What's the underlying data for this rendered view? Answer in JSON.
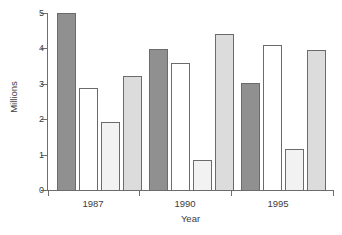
{
  "chart_data": {
    "type": "bar",
    "title": "",
    "xlabel": "Year",
    "ylabel": "Millions",
    "categories": [
      "1987",
      "1990",
      "1995"
    ],
    "ylim": [
      0,
      5
    ],
    "yticks": [
      0,
      1,
      2,
      3,
      4,
      5
    ],
    "ytick_labels": [
      "0",
      "1",
      "2",
      "3",
      "4",
      "5"
    ],
    "grid": false,
    "legend": "none",
    "series": [
      {
        "name": "Series 1",
        "color": "#909090",
        "values": [
          5.0,
          4.0,
          3.03
        ]
      },
      {
        "name": "Series 2",
        "color": "#ffffff",
        "values": [
          2.9,
          3.6,
          4.1
        ]
      },
      {
        "name": "Series 3",
        "color": "#f2f2f2",
        "values": [
          1.93,
          0.88,
          1.18
        ]
      },
      {
        "name": "Series 4",
        "color": "#dcdcdc",
        "values": [
          3.22,
          4.4,
          3.95
        ]
      }
    ]
  },
  "axis": {
    "y_label": "Millions",
    "x_label": "Year",
    "y_tick_0": "0",
    "y_tick_1": "1",
    "y_tick_2": "2",
    "y_tick_3": "3",
    "y_tick_4": "4",
    "y_tick_5": "5",
    "x_tick_0": "1987",
    "x_tick_1": "1990",
    "x_tick_2": "1995"
  },
  "colors": {
    "axis": "#6e6e6e",
    "bar_outline": "#6b6b6b",
    "text": "#3d3d3d",
    "background": "#ffffff"
  }
}
